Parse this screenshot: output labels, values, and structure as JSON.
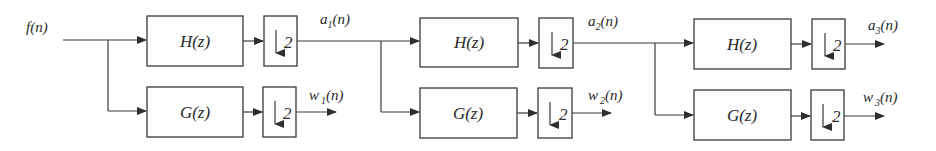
{
  "diagram": {
    "input": {
      "label": "f(n)"
    },
    "stages": [
      {
        "lowpass": {
          "label": "H(z)"
        },
        "highpass": {
          "label": "G(z)"
        },
        "downsample_label": "2",
        "approx_out": {
          "base": "a",
          "sub": "1",
          "tail": "(n)"
        },
        "detail_out": {
          "base": "w",
          "sub": "1",
          "tail": "(n)"
        }
      },
      {
        "lowpass": {
          "label": "H(z)"
        },
        "highpass": {
          "label": "G(z)"
        },
        "downsample_label": "2",
        "approx_out": {
          "base": "a",
          "sub": "2",
          "tail": "(n)"
        },
        "detail_out": {
          "base": "w",
          "sub": "2",
          "tail": "(n)"
        }
      },
      {
        "lowpass": {
          "label": "H(z)"
        },
        "highpass": {
          "label": "G(z)"
        },
        "downsample_label": "2",
        "approx_out": {
          "base": "a",
          "sub": "3",
          "tail": "(n)"
        },
        "detail_out": {
          "base": "w",
          "sub": "3",
          "tail": "(n)"
        }
      }
    ],
    "colors": {
      "stroke": "#3a3a3a",
      "text": "#2a2a2a",
      "background": "#ffffff"
    }
  }
}
